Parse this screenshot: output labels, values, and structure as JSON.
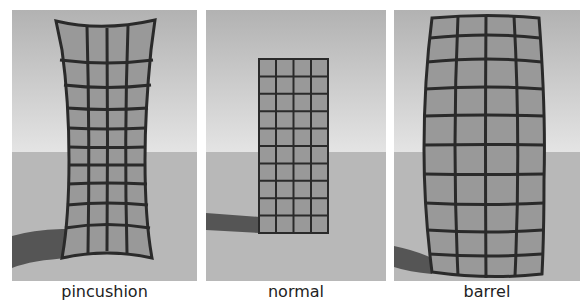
{
  "panels": [
    {
      "id": "pincushion",
      "label": "pincushion"
    },
    {
      "id": "normal",
      "label": "normal"
    },
    {
      "id": "barrel",
      "label": "barrel"
    }
  ],
  "colors": {
    "sky_top": "#b4b4b4",
    "sky_horizon": "#e2e2e2",
    "ground": "#b9b9b9",
    "shadow": "#555555",
    "grid_fill": "#9a9a9a",
    "grid_line": "#2a2a2a"
  },
  "grid": {
    "columns": 4,
    "rows": 10
  }
}
